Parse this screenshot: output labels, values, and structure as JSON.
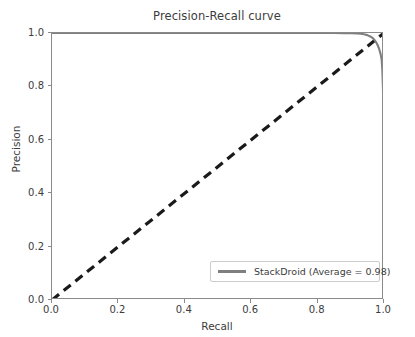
{
  "chart_data": {
    "type": "line",
    "title": "Precision-Recall curve",
    "xlabel": "Recall",
    "ylabel": "Precision",
    "xlim": [
      0.0,
      1.0
    ],
    "ylim": [
      0.0,
      1.0
    ],
    "grid": false,
    "legend_position": "lower right",
    "xticks": [
      "0.0",
      "0.2",
      "0.4",
      "0.6",
      "0.8",
      "1.0"
    ],
    "xtick_values": [
      0.0,
      0.2,
      0.4,
      0.6,
      0.8,
      1.0
    ],
    "yticks": [
      "0.0",
      "0.2",
      "0.4",
      "0.6",
      "0.8",
      "1.0"
    ],
    "ytick_values": [
      0.0,
      0.2,
      0.4,
      0.6,
      0.8,
      1.0
    ],
    "series": [
      {
        "name": "StackDroid (Average = 0.98)",
        "legend_label": "StackDroid (Average = 0.98)",
        "average_precision": 0.98,
        "color": "#7f7f7f",
        "linestyle": "solid",
        "linewidth": 2,
        "x": [
          0.0,
          0.05,
          0.1,
          0.15,
          0.2,
          0.25,
          0.3,
          0.35,
          0.4,
          0.45,
          0.5,
          0.55,
          0.6,
          0.65,
          0.7,
          0.75,
          0.8,
          0.85,
          0.88,
          0.9,
          0.92,
          0.93,
          0.94,
          0.95,
          0.96,
          0.965,
          0.97,
          0.975,
          0.98,
          0.985,
          0.99,
          0.993,
          0.995,
          0.997,
          0.998,
          0.999,
          1.0
        ],
        "y": [
          1.0,
          1.0,
          1.0,
          1.0,
          1.0,
          1.0,
          1.0,
          1.0,
          1.0,
          1.0,
          1.0,
          1.0,
          1.0,
          1.0,
          1.0,
          1.0,
          1.0,
          1.0,
          0.999,
          0.999,
          0.998,
          0.997,
          0.995,
          0.992,
          0.986,
          0.982,
          0.976,
          0.968,
          0.957,
          0.942,
          0.92,
          0.9,
          0.86,
          0.79,
          0.72,
          0.62,
          0.48
        ]
      },
      {
        "name": "baseline",
        "legend_label": "",
        "color": "#1a1a1a",
        "linestyle": "dashed",
        "linewidth": 3,
        "x": [
          0.0,
          1.0
        ],
        "y": [
          0.0,
          1.0
        ]
      }
    ]
  },
  "legend": {
    "entries": [
      {
        "label": "StackDroid (Average = 0.98)",
        "color": "#7f7f7f"
      }
    ]
  },
  "colors": {
    "curve": "#7f7f7f",
    "baseline": "#1a1a1a",
    "axis": "#8a8a8a",
    "text": "#3c3c3c",
    "background": "#ffffff"
  }
}
